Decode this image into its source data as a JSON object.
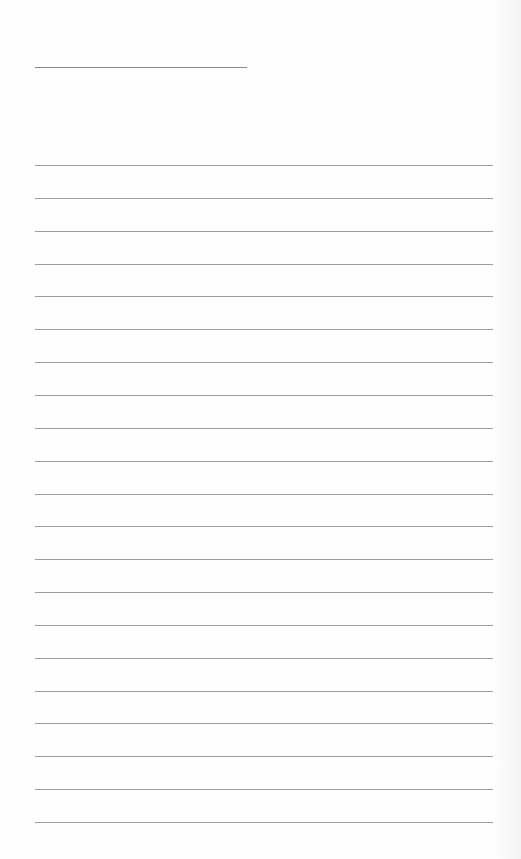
{
  "page": {
    "type": "lined-notepaper",
    "background_color": "#fefefe",
    "line_color": "#9c9c9c"
  },
  "title_line": {
    "x": 35,
    "y": 67,
    "width": 212
  },
  "rules": {
    "count": 21,
    "x": 35,
    "width": 458,
    "first_y": 165,
    "spacing": 32.85
  }
}
